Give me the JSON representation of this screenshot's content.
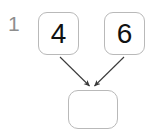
{
  "exercise": {
    "number": "1",
    "number_color": "#8e8e8e"
  },
  "diagram": {
    "type": "addition-bond",
    "box_border_color": "#b9b9b9",
    "arrow_color": "#3a3a3a",
    "nodes": [
      {
        "id": "left-addend",
        "label": "4",
        "filled": true
      },
      {
        "id": "right-addend",
        "label": "6",
        "filled": true
      },
      {
        "id": "sum-answer",
        "label": "",
        "filled": false
      }
    ],
    "arrows": [
      {
        "from": "left-addend",
        "to": "sum-answer"
      },
      {
        "from": "right-addend",
        "to": "sum-answer"
      }
    ]
  }
}
